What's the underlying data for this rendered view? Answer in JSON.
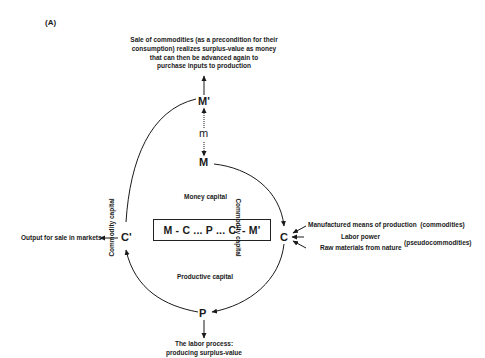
{
  "panel_label": "(A)",
  "top_note": {
    "lines": [
      "Sale of commodities (as a  precondition for their",
      "consumption) realizes surplus-value as money",
      "that can then be advanced again to",
      "purchase inputs to production"
    ]
  },
  "nodes": {
    "m_prime": "M'",
    "m_small": "m",
    "m": "M",
    "c": "C",
    "c_prime": "C'",
    "p": "P"
  },
  "formula": "M - C ... P ... C' - M'",
  "phase_labels": {
    "money_capital": "Money capital",
    "productive_capital": "Productive capital",
    "commodity_capital_left": "Commodity capital",
    "commodity_capital_right": "Commodity capital"
  },
  "inputs": {
    "manufactured": "Manufactured means of production",
    "commodities_tag": "(commodities)",
    "labor_power": "Labor power",
    "raw_materials": "Raw materials from nature",
    "pseudo_tag": "(pseudocommodities)"
  },
  "output_label": "Output for sale in markets",
  "bottom_note": {
    "lines": [
      "The labor process:",
      "producing surplus-value"
    ]
  },
  "colors": {
    "ink": "#1a1a1a",
    "background": "#ffffff"
  }
}
